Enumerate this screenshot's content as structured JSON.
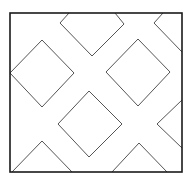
{
  "diagram": {
    "width": 188,
    "height": 180,
    "background": "#ffffff",
    "frame": {
      "x1": 10,
      "y1": 13,
      "x2": 182,
      "y2": 172,
      "stroke": "#1a1a1a",
      "stroke_width": 1.6
    },
    "shape_stroke": "#555555",
    "shape_stroke_width": 1,
    "shapes": [
      {
        "name": "top-center-notch",
        "points": "69,13 60,23 92,56 124,24 115,13"
      },
      {
        "name": "top-right-notch",
        "points": "163,13 154,23 182,52"
      },
      {
        "name": "left-diamond",
        "points": "42,40 74,73 42,107 10,73"
      },
      {
        "name": "right-diamond",
        "points": "138,39 170,72 138,106 106,72"
      },
      {
        "name": "center-diamond",
        "points": "89,91 122,124 89,157 58,124"
      },
      {
        "name": "right-edge-notch",
        "points": "182,100 157,124 182,148"
      },
      {
        "name": "bottom-left-triangle",
        "points": "12,172 42,141 72,172"
      },
      {
        "name": "bottom-right-triangle",
        "points": "112,172 139,143 167,172"
      }
    ]
  }
}
